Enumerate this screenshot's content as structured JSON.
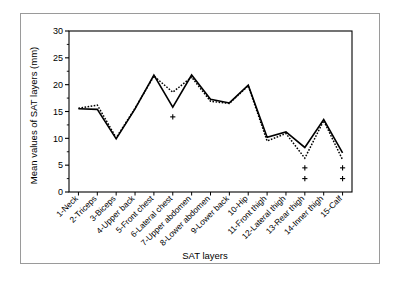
{
  "figure": {
    "border_color": "#9a9a9a",
    "background": "#ffffff"
  },
  "chart_data": {
    "type": "line",
    "title": "",
    "xlabel": "SAT layers",
    "ylabel": "Mean values of SAT layers (mm)",
    "categories": [
      "1-Neck",
      "2-Triceps",
      "3-Biceps",
      "4-Upper back",
      "5-Front chest",
      "6-Lateral chest",
      "7-Upper abdomen",
      "8-Lower abdomen",
      "9-Lower back",
      "10-Hip",
      "11-Front thigh",
      "12-Lateral thigh",
      "13-Rear thigh",
      "14-Inner thigh",
      "15-Calf"
    ],
    "series": [
      {
        "name": "solid",
        "style": "solid",
        "color": "#000000",
        "values": [
          15.5,
          15.4,
          9.9,
          15.5,
          21.8,
          15.8,
          21.8,
          17.3,
          16.6,
          19.9,
          10.2,
          11.2,
          8.3,
          13.5,
          7.3
        ]
      },
      {
        "name": "dotted",
        "style": "dotted",
        "color": "#000000",
        "values": [
          15.6,
          16.2,
          10.1,
          15.6,
          21.6,
          18.6,
          21.4,
          16.9,
          16.5,
          19.8,
          9.5,
          10.9,
          6.3,
          13.3,
          6.0
        ]
      }
    ],
    "markers": [
      {
        "category_index": 5,
        "value": 14.0,
        "glyph": "+"
      },
      {
        "category_index": 12,
        "value": 4.5,
        "glyph": "+"
      },
      {
        "category_index": 12,
        "value": 2.5,
        "glyph": "+"
      },
      {
        "category_index": 14,
        "value": 4.5,
        "glyph": "+"
      },
      {
        "category_index": 14,
        "value": 2.5,
        "glyph": "+"
      }
    ],
    "ylim": [
      0,
      30
    ],
    "yticks": [
      0,
      5,
      10,
      15,
      20,
      25,
      30
    ],
    "ytick_labels": [
      "0",
      "5",
      "10",
      "15",
      "20",
      "25",
      "30"
    ],
    "grid": false,
    "legend": "none",
    "axis_color": "#000000",
    "plot_frame": true
  }
}
